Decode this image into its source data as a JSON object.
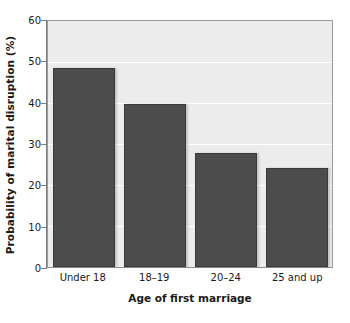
{
  "chart_data": {
    "type": "bar",
    "title": "",
    "subtitle": "",
    "xlabel": "Age of first marriage",
    "ylabel": "Probability of marital disruption (%)",
    "categories": [
      "Under 18",
      "18–19",
      "20–24",
      "25 and up"
    ],
    "values": [
      48.5,
      39.8,
      27.8,
      24.2
    ],
    "ylim": [
      0,
      60
    ],
    "yticks": [
      0,
      10,
      20,
      30,
      40,
      50,
      60
    ],
    "ytick_labels": [
      "0",
      "10",
      "20",
      "30",
      "40",
      "50",
      "60"
    ],
    "grid": true,
    "grid_orientation": "horizontal",
    "legend": false,
    "legend_position": "none",
    "annotations": [],
    "colors": {
      "bar_fill": "#4c4c4c",
      "bar_edge": "#3a3a3a",
      "plot_background": "#ececec",
      "figure_background": "#ffffff",
      "gridline": "#ffffff",
      "axis_line": "#7d7d7d",
      "text": "#1a1a1a"
    }
  }
}
